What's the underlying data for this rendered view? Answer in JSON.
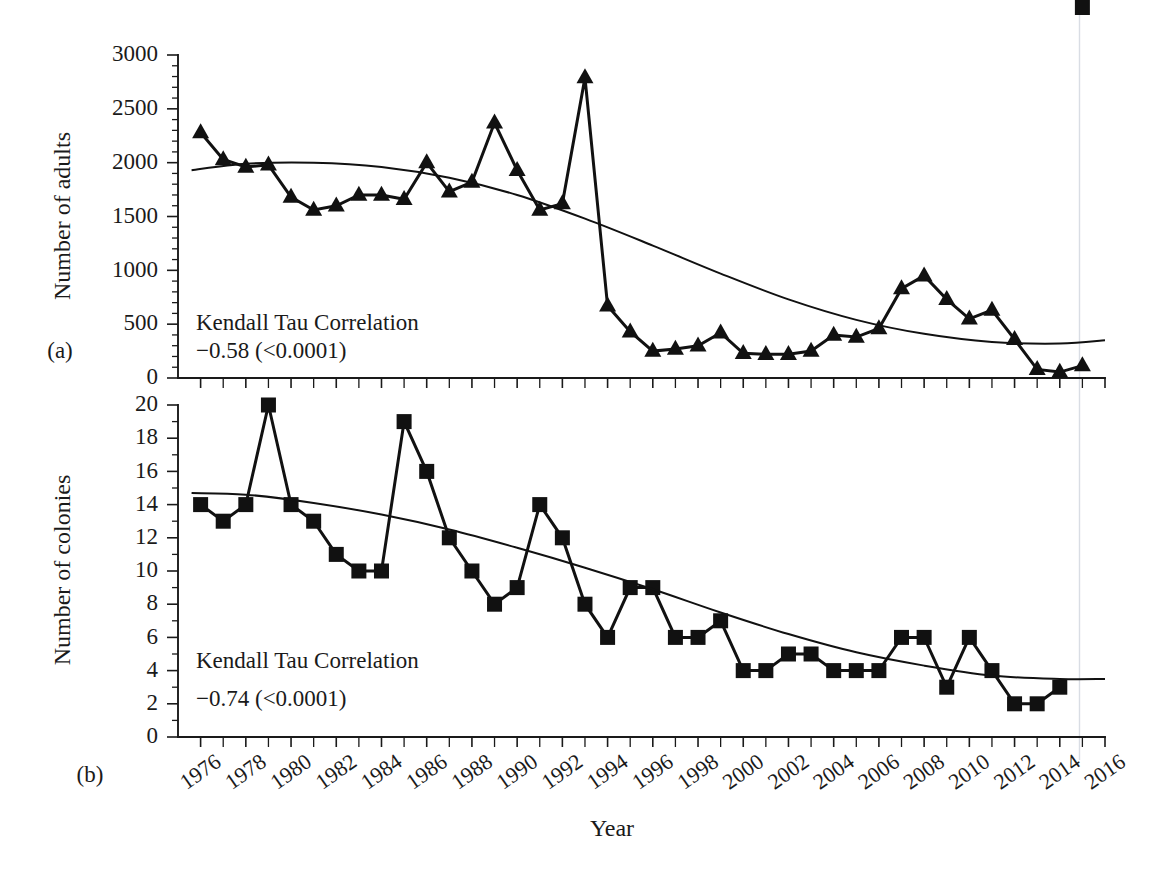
{
  "figure": {
    "xlabel": "Year",
    "panels": [
      {
        "id": "a",
        "panel_label": "(a)",
        "ylabel": "Number of adults",
        "annotation_line1": "Kendall Tau Correlation",
        "annotation_line2": "−0.58 (<0.0001)"
      },
      {
        "id": "b",
        "panel_label": "(b)",
        "ylabel": "Number of colonies",
        "annotation_line1": "Kendall Tau Correlation",
        "annotation_line2": "−0.74 (<0.0001)"
      }
    ]
  },
  "chart_data": [
    {
      "type": "line",
      "panel": "a",
      "title": "",
      "xlabel": "Year",
      "ylabel": "Number of adults",
      "xlim": [
        1975,
        2016
      ],
      "ylim": [
        0,
        3000
      ],
      "ytick_labels": [
        "0",
        "500",
        "1000",
        "1500",
        "2000",
        "2500",
        "3000"
      ],
      "yticks": [
        0,
        500,
        1000,
        1500,
        2000,
        2500,
        3000
      ],
      "y_minor_step": 100,
      "xticks": [
        1976,
        1978,
        1980,
        1982,
        1984,
        1986,
        1988,
        1990,
        1992,
        1994,
        1996,
        1998,
        2000,
        2002,
        2004,
        2006,
        2008,
        2010,
        2012,
        2014,
        2016
      ],
      "xtick_labels": [
        "1976",
        "1978",
        "1980",
        "1982",
        "1984",
        "1986",
        "1988",
        "1990",
        "1992",
        "1994",
        "1996",
        "1998",
        "2000",
        "2002",
        "2004",
        "2006",
        "2008",
        "2010",
        "2012",
        "2014",
        "2016"
      ],
      "x_minor_step": 1,
      "grid": false,
      "legend": "none",
      "marker": "triangle",
      "annotations": [
        "Kendall Tau Correlation",
        "−0.58 (<0.0001)"
      ],
      "series": [
        {
          "name": "Number of adults",
          "x": [
            1976,
            1977,
            1978,
            1979,
            1980,
            1981,
            1982,
            1983,
            1984,
            1985,
            1986,
            1987,
            1988,
            1989,
            1990,
            1991,
            1992,
            1993,
            1994,
            1995,
            1996,
            1997,
            1998,
            1999,
            2000,
            2001,
            2002,
            2003,
            2004,
            2005,
            2006,
            2007,
            2008,
            2009,
            2010,
            2011,
            2012,
            2013,
            2014,
            2015
          ],
          "values": [
            2280,
            2030,
            1960,
            1980,
            1680,
            1560,
            1600,
            1700,
            1700,
            1660,
            2000,
            1730,
            1820,
            2370,
            1930,
            1560,
            1620,
            2790,
            670,
            430,
            250,
            270,
            300,
            420,
            230,
            220,
            220,
            250,
            400,
            380,
            460,
            830,
            950,
            730,
            550,
            630,
            360,
            80,
            55,
            115,
            295
          ],
          "trend_name": "fitted trend",
          "trend": {
            "x": [
              1975.6,
              1978,
              1981,
              1984,
              1987,
              1990,
              1993,
              1996,
              1999,
              2002,
              2005,
              2008,
              2011,
              2014,
              2016
            ],
            "values": [
              1930,
              1990,
              2000,
              1960,
              1860,
              1700,
              1480,
              1230,
              970,
              730,
              540,
              410,
              335,
              320,
              350
            ]
          }
        }
      ]
    },
    {
      "type": "line",
      "panel": "b",
      "title": "",
      "xlabel": "Year",
      "ylabel": "Number of colonies",
      "xlim": [
        1975,
        2016
      ],
      "ylim": [
        0,
        20
      ],
      "ytick_labels": [
        "0",
        "2",
        "4",
        "6",
        "8",
        "10",
        "12",
        "14",
        "16",
        "18",
        "20"
      ],
      "yticks": [
        0,
        2,
        4,
        6,
        8,
        10,
        12,
        14,
        16,
        18,
        20
      ],
      "y_minor_step": 1,
      "xticks": [
        1976,
        1978,
        1980,
        1982,
        1984,
        1986,
        1988,
        1990,
        1992,
        1994,
        1996,
        1998,
        2000,
        2002,
        2004,
        2006,
        2008,
        2010,
        2012,
        2014,
        2016
      ],
      "xtick_labels": [
        "1976",
        "1978",
        "1980",
        "1982",
        "1984",
        "1986",
        "1988",
        "1990",
        "1992",
        "1994",
        "1996",
        "1998",
        "2000",
        "2002",
        "2004",
        "2006",
        "2008",
        "2010",
        "2012",
        "2014",
        "2016"
      ],
      "x_minor_step": 1,
      "grid": false,
      "legend": "none",
      "marker": "square",
      "annotations": [
        "Kendall Tau Correlation",
        "−0.74 (<0.0001)"
      ],
      "series": [
        {
          "name": "Number of colonies",
          "x": [
            1976,
            1977,
            1978,
            1979,
            1980,
            1981,
            1982,
            1983,
            1984,
            1985,
            1986,
            1987,
            1988,
            1989,
            1990,
            1991,
            1992,
            1993,
            1994,
            1995,
            1996,
            1997,
            1998,
            1999,
            2000,
            2001,
            2002,
            2003,
            2004,
            2005,
            2006,
            2007,
            2008,
            2009,
            2010,
            2011,
            2012,
            2013,
            2014,
            2015
          ],
          "values": [
            14,
            13,
            14,
            20,
            14,
            13,
            11,
            10,
            10,
            19,
            16,
            12,
            10,
            8,
            9,
            14,
            12,
            8,
            6,
            9,
            9,
            6,
            6,
            7,
            4,
            4,
            5,
            5,
            4,
            4,
            4,
            6,
            6,
            3,
            6,
            4,
            2,
            2,
            3
          ],
          "trend_name": "fitted trend",
          "trend": {
            "x": [
              1975.6,
              1978,
              1981,
              1984,
              1987,
              1990,
              1993,
              1996,
              1999,
              2002,
              2005,
              2008,
              2011,
              2014,
              2016
            ],
            "values": [
              14.7,
              14.6,
              14.1,
              13.4,
              12.5,
              11.4,
              10.2,
              8.9,
              7.5,
              6.2,
              5.1,
              4.3,
              3.7,
              3.5,
              3.5
            ]
          }
        }
      ]
    }
  ]
}
